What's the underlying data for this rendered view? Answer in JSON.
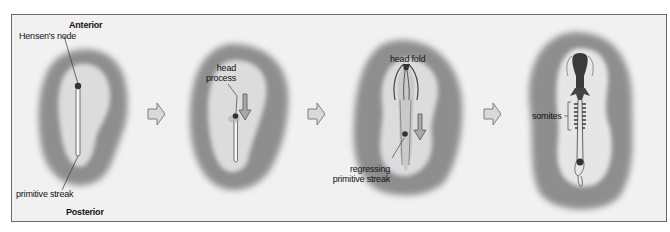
{
  "figure": {
    "stages": [
      {
        "id": "stage1",
        "labels": {
          "anterior": "Anterior",
          "hensens_node": "Hensen's node",
          "primitive_streak": "primitive streak",
          "posterior": "Posterior"
        }
      },
      {
        "id": "stage2",
        "labels": {
          "head_process_line1": "head",
          "head_process_line2": "process"
        }
      },
      {
        "id": "stage3",
        "labels": {
          "head_fold": "head fold",
          "regressing_line1": "regressing",
          "regressing_line2": "primitive streak"
        }
      },
      {
        "id": "stage4",
        "labels": {
          "somites": "somites"
        }
      }
    ],
    "arrows": [
      "stage-arrow-right",
      "stage-arrow-right",
      "stage-arrow-right"
    ],
    "colors": {
      "background": "#f1f1f1",
      "border": "#6a6a6a",
      "area_opaca": "#8e8e8e",
      "area_pellucida": "#dcdcdc",
      "node": "#333333",
      "arrow_fill": "#d9d9d9",
      "arrow_stroke": "#666666"
    }
  }
}
